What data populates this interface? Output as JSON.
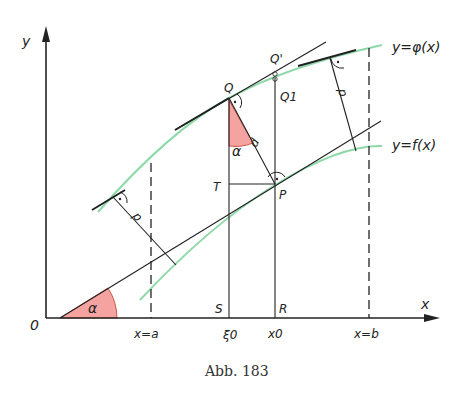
{
  "figure": {
    "caption": "Abb. 183",
    "axes": {
      "x_label": "x",
      "y_label": "y",
      "origin_label": "0"
    },
    "curves": {
      "upper": {
        "label": "y=φ(x)",
        "color": "#8fd9a8"
      },
      "lower": {
        "label": "y=f(x)",
        "color": "#8fd9a8"
      }
    },
    "points": {
      "Q": "Q",
      "Q_prime": "Q'",
      "Q1": "Q1",
      "P": "P",
      "T": "T",
      "S": "S",
      "R": "R"
    },
    "x_ticks": {
      "a": "x=a",
      "xi0": "ξ0",
      "x0": "x0",
      "b": "x=b"
    },
    "angle_label": "α",
    "distance_label": "d",
    "angle_fill_color": "#f4a3a0"
  }
}
